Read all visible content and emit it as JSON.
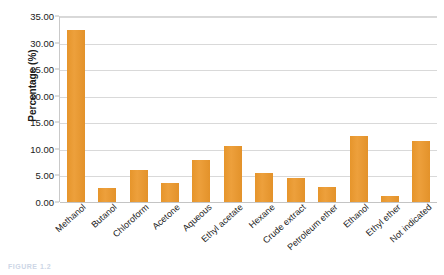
{
  "chart_data": {
    "type": "bar",
    "title": "",
    "subtitle": "",
    "xlabel": "",
    "ylabel": "Percentage (%)",
    "ylim": [
      0,
      35
    ],
    "ytick_labels": [
      "0.00",
      "5.00",
      "10.00",
      "15.00",
      "20.00",
      "25.00",
      "30.00",
      "35.00"
    ],
    "ytick_values": [
      0,
      5,
      10,
      15,
      20,
      25,
      30,
      35
    ],
    "grid": true,
    "legend": "none",
    "bar_color": "#E8982F",
    "categories": [
      "Methanol",
      "Butanol",
      "Chloroform",
      "Acetone",
      "Aqueous",
      "Ethyl acetate",
      "Hexane",
      "Crude extract",
      "Petroleum ether",
      "Ethanol",
      "Ethyl ether",
      "Not indicated"
    ],
    "values": [
      32.4,
      2.7,
      6.1,
      3.6,
      7.9,
      10.5,
      5.5,
      4.6,
      2.8,
      12.4,
      1.1,
      11.5
    ]
  },
  "caption": {
    "text": "FIGURE 1.2"
  }
}
